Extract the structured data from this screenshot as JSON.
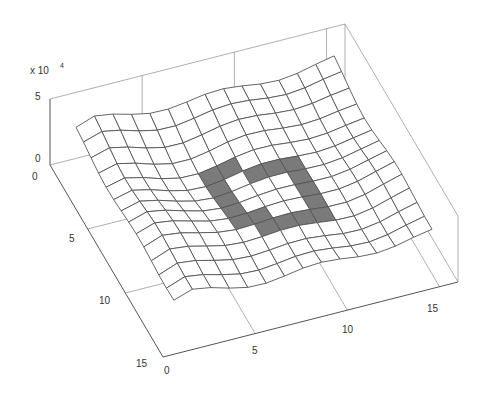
{
  "chart_data": {
    "type": "surface",
    "title": "",
    "xlabel": "",
    "ylabel": "",
    "zlabel": "",
    "z_multiplier_label": "x 10^4",
    "x_ticks": [
      0,
      5,
      10,
      15
    ],
    "y_ticks": [
      0,
      5,
      10,
      15
    ],
    "z_ticks": [
      0,
      5
    ],
    "xlim": [
      0,
      16
    ],
    "ylim": [
      0,
      15
    ],
    "zlim": [
      0,
      5
    ],
    "grid_size": [
      16,
      15
    ],
    "base_height": 3.2,
    "highlight_cells": [
      [
        6,
        5
      ],
      [
        6,
        6
      ],
      [
        6,
        7
      ],
      [
        6,
        8
      ],
      [
        6,
        9
      ],
      [
        7,
        5
      ],
      [
        7,
        9
      ],
      [
        7,
        10
      ],
      [
        8,
        6
      ],
      [
        8,
        10
      ],
      [
        9,
        6
      ],
      [
        9,
        10
      ],
      [
        10,
        6
      ],
      [
        10,
        7
      ],
      [
        10,
        8
      ],
      [
        10,
        9
      ],
      [
        10,
        10
      ]
    ],
    "dip": {
      "center": [
        8,
        8
      ],
      "depth": 1.3,
      "radius": 2.5
    }
  },
  "labels": {
    "multiplier_base": "x 10",
    "multiplier_exp": "4",
    "z5": "5",
    "z0": "0",
    "y0": "0",
    "y5": "5",
    "y10": "10",
    "y15": "15",
    "x0": "0",
    "x5": "5",
    "x10": "10",
    "x15": "15"
  }
}
